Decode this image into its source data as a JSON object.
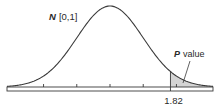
{
  "chart_data": {
    "type": "area",
    "title": "",
    "distribution": "standard normal",
    "mean": 0,
    "sd": 1,
    "xlim": [
      -3.1,
      3.1
    ],
    "ticks": [
      -2,
      -1,
      0,
      1,
      2
    ],
    "critical_value": 1.82,
    "critical_value_label": "1.82",
    "shaded_region": "right tail",
    "annotations": {
      "distribution_label_symbol": "N",
      "distribution_label_params": "[0,1]",
      "pvalue_label_symbol": "P",
      "pvalue_label_text": "value"
    },
    "colors": {
      "curve": "#3a3a3a",
      "shade": "#d4d4d4",
      "axis": "#3a3a3a"
    }
  }
}
